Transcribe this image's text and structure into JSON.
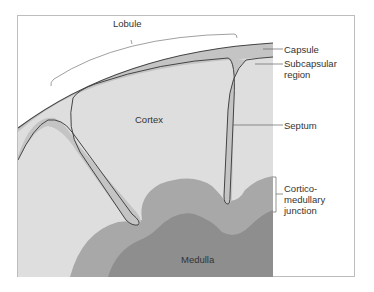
{
  "figure": {
    "type": "anatomical-diagram",
    "colors": {
      "background": "#ffffff",
      "frame": "#bdbdbd",
      "capsule_septum": "#c4c4c4",
      "cortex": "#dedede",
      "corticomedullary": "#a8a8a8",
      "medulla": "#8e8e8e",
      "outline": "#444444",
      "leader_line": "#666666"
    }
  },
  "labels": {
    "lobule": "Lobule",
    "capsule": "Capsule",
    "subcapsular_1": "Subcapsular",
    "subcapsular_2": "region",
    "cortex": "Cortex",
    "septum": "Septum",
    "cm_junction_1": "Cortico-",
    "cm_junction_2": "medullary",
    "cm_junction_3": "junction",
    "medulla": "Medulla"
  }
}
